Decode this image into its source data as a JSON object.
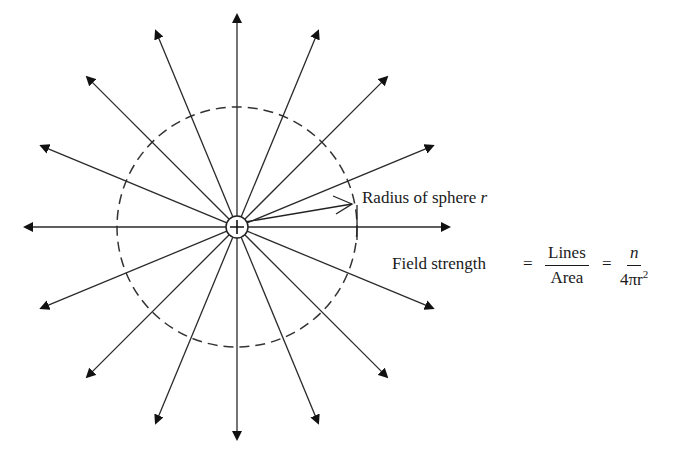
{
  "diagram": {
    "type": "radial-field-lines",
    "center": {
      "x": 237,
      "y": 227
    },
    "charge_symbol": "+",
    "sphere": {
      "radius_px": 120,
      "style": "dashed"
    },
    "line_count": 16,
    "line_length_px": 212,
    "line_color": "#2a2a2a"
  },
  "labels": {
    "radius": "Radius of sphere ",
    "radius_var": "r",
    "field_strength": "Field strength",
    "equals1": "=",
    "equals2": "=",
    "frac1_num": "Lines",
    "frac1_den": "Area",
    "frac2_num": "n",
    "frac2_den_pre": "4πr",
    "frac2_den_exp": "2"
  }
}
